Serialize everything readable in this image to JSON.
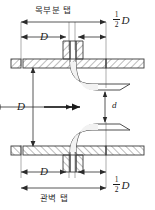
{
  "figure": {
    "type": "engineering-cross-section-diagram",
    "background_color": "#ffffff",
    "line_color": "#3a3a3a",
    "hatch_color": "#6b6b6b"
  },
  "labels": {
    "top_caption": "목부분 탭",
    "bottom_caption": "관벽 탭",
    "pipe_diameter": "D",
    "throat_diameter": "d",
    "half_numerator": "1",
    "half_denominator": "2",
    "half_symbol": "D"
  },
  "dimensions": {
    "top_upstream": "D",
    "top_downstream_numerator": "1",
    "top_downstream_denominator": "2",
    "top_downstream_symbol": "D",
    "vertical": "D",
    "bottom_upstream": "D",
    "bottom_downstream_numerator": "1",
    "bottom_downstream_denominator": "2",
    "bottom_downstream_symbol": "D",
    "throat": "d"
  },
  "flow": {
    "direction": "right",
    "arrow_glyph": "→"
  }
}
